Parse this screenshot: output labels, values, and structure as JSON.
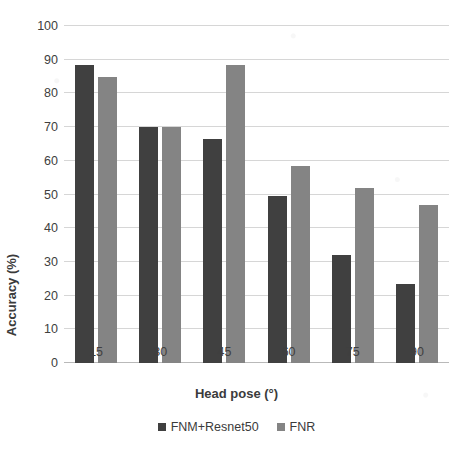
{
  "chart_data": {
    "type": "bar",
    "title": "",
    "xlabel": "Head pose (°)",
    "ylabel": "Accuracy (%)",
    "categories": [
      "15",
      "30",
      "45",
      "60",
      "75",
      "90"
    ],
    "series": [
      {
        "name": "FNM+Resnet50",
        "color": "#404040",
        "values": [
          88.5,
          70,
          66.5,
          49.5,
          32,
          23.5
        ]
      },
      {
        "name": "FNR",
        "color": "#848484",
        "values": [
          85,
          70,
          88.5,
          58.5,
          52,
          47
        ]
      }
    ],
    "ylim": [
      0,
      100
    ],
    "yticks": [
      0,
      10,
      20,
      30,
      40,
      50,
      60,
      70,
      80,
      90,
      100
    ],
    "ytick_labels": [
      "0",
      "10",
      "20",
      "30",
      "40",
      "50",
      "60",
      "70",
      "80",
      "90",
      "100"
    ],
    "grid": true,
    "grid_axis": "y",
    "legend_position": "bottom"
  },
  "legend": {
    "items": [
      {
        "label": "FNM+Resnet50",
        "swatch": "#404040"
      },
      {
        "label": "FNR",
        "swatch": "#848484"
      }
    ]
  }
}
